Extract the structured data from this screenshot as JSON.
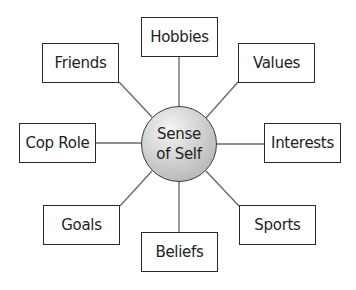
{
  "diagram": {
    "center": {
      "line1": "Sense",
      "line2": "of Self"
    },
    "nodes": [
      {
        "label": "Hobbies",
        "position": "top"
      },
      {
        "label": "Values",
        "position": "top-right"
      },
      {
        "label": "Interests",
        "position": "right"
      },
      {
        "label": "Sports",
        "position": "bottom-right"
      },
      {
        "label": "Beliefs",
        "position": "bottom"
      },
      {
        "label": "Goals",
        "position": "bottom-left"
      },
      {
        "label": "Cop Role",
        "position": "left"
      },
      {
        "label": "Friends",
        "position": "top-left"
      }
    ]
  }
}
